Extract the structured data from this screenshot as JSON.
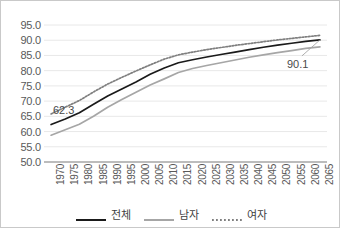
{
  "chart_data": {
    "type": "line",
    "title": "",
    "subtitle": "",
    "xlabel": "",
    "ylabel": "",
    "grid": true,
    "legend_position": "bottom",
    "ylim": [
      50.0,
      95.0
    ],
    "ytick_labels": [
      "95.0",
      "90.0",
      "85.0",
      "80.0",
      "75.0",
      "70.0",
      "65.0",
      "60.0",
      "55.0",
      "50.0"
    ],
    "ytick_values": [
      95.0,
      90.0,
      85.0,
      80.0,
      75.0,
      70.0,
      65.0,
      60.0,
      55.0,
      50.0
    ],
    "categories": [
      "1970",
      "1975",
      "1980",
      "1985",
      "1990",
      "1995",
      "2000",
      "2005",
      "2010",
      "2015",
      "2020",
      "2025",
      "2030",
      "2035",
      "2040",
      "2045",
      "2050",
      "2055",
      "2060",
      "2065"
    ],
    "x": [
      1970,
      1975,
      1980,
      1985,
      1990,
      1995,
      2000,
      2005,
      2010,
      2015,
      2020,
      2025,
      2030,
      2035,
      2040,
      2045,
      2050,
      2055,
      2060,
      2065
    ],
    "series": [
      {
        "name": "전체",
        "style": "solid",
        "color": "#1a1a1a",
        "values": [
          62.3,
          64.1,
          66.2,
          69.0,
          71.7,
          74.0,
          76.3,
          78.8,
          80.9,
          82.6,
          83.6,
          84.5,
          85.3,
          86.1,
          86.9,
          87.7,
          88.4,
          89.0,
          89.6,
          90.1
        ]
      },
      {
        "name": "남자",
        "style": "solid",
        "color": "#a6a6a6",
        "values": [
          58.8,
          60.6,
          62.4,
          65.0,
          68.0,
          70.5,
          72.9,
          75.3,
          77.3,
          79.4,
          80.7,
          81.7,
          82.6,
          83.5,
          84.4,
          85.2,
          85.9,
          86.6,
          87.3,
          87.8
        ]
      },
      {
        "name": "여자",
        "style": "dotted",
        "color": "#7f7f7f",
        "values": [
          65.8,
          68.0,
          70.2,
          73.0,
          75.6,
          77.8,
          79.9,
          81.9,
          83.8,
          85.2,
          86.1,
          86.9,
          87.6,
          88.3,
          88.9,
          89.5,
          90.1,
          90.6,
          91.1,
          91.6
        ]
      }
    ],
    "annotations": [
      {
        "name": "start-value-label",
        "text": "62.3",
        "series": "전체",
        "x": 1970,
        "y": 62.3
      },
      {
        "name": "end-value-label",
        "text": "90.1",
        "series": "전체",
        "x": 2065,
        "y": 90.1
      }
    ]
  },
  "legend": {
    "items": [
      {
        "label": "전체"
      },
      {
        "label": "남자"
      },
      {
        "label": "여자"
      }
    ]
  },
  "colors": {
    "total": "#1a1a1a",
    "male": "#a6a6a6",
    "female": "#7f7f7f",
    "grid": "#e8e8e8",
    "axis": "#a6a6a6",
    "text": "#595959",
    "border": "#c9c9c9"
  }
}
